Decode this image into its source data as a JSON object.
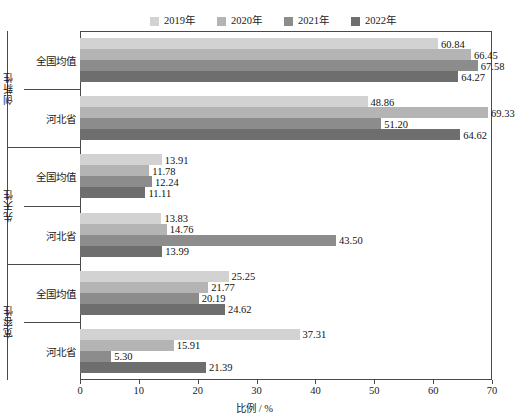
{
  "chart_data": {
    "type": "bar",
    "orientation": "horizontal",
    "title": "",
    "xlabel": "比例 / %",
    "ylabel": "",
    "xlim": [
      0,
      70
    ],
    "xticks": [
      0,
      10,
      20,
      30,
      40,
      50,
      60,
      70
    ],
    "grid": false,
    "legend_position": "top",
    "legend": [
      "2019年",
      "2020年",
      "2021年",
      "2022年"
    ],
    "series": [
      {
        "name": "2019年",
        "color": "#d2d2d2",
        "values": [
          60.84,
          48.86,
          13.91,
          13.83,
          25.25,
          37.31
        ]
      },
      {
        "name": "2020年",
        "color": "#b4b4b4",
        "values": [
          66.45,
          69.33,
          11.78,
          14.76,
          21.77,
          15.91
        ]
      },
      {
        "name": "2021年",
        "color": "#8c8c8c",
        "values": [
          67.58,
          51.2,
          12.24,
          43.5,
          20.19,
          5.3
        ]
      },
      {
        "name": "2022年",
        "color": "#6e6e6e",
        "values": [
          64.27,
          64.62,
          11.11,
          13.99,
          24.62,
          21.39
        ]
      }
    ],
    "categories": [
      "全国均值",
      "河北省",
      "全国均值",
      "河北省",
      "全国均值",
      "河北省"
    ],
    "groups": [
      {
        "title": "创新性",
        "categories": [
          "全国均值",
          "河北省"
        ]
      },
      {
        "title": "先天性",
        "categories": [
          "全国均值",
          "河北省"
        ]
      },
      {
        "title": "宽容性",
        "categories": [
          "全国均值",
          "河北省"
        ]
      }
    ],
    "value_labels": [
      [
        "60.84",
        "66.45",
        "67.58",
        "64.27"
      ],
      [
        "48.86",
        "69.33",
        "51.20",
        "64.62"
      ],
      [
        "13.91",
        "11.78",
        "12.24",
        "11.11"
      ],
      [
        "13.83",
        "14.76",
        "43.50",
        "13.99"
      ],
      [
        "25.25",
        "21.77",
        "20.19",
        "24.62"
      ],
      [
        "37.31",
        "15.91",
        "5.30",
        "21.39"
      ]
    ]
  }
}
